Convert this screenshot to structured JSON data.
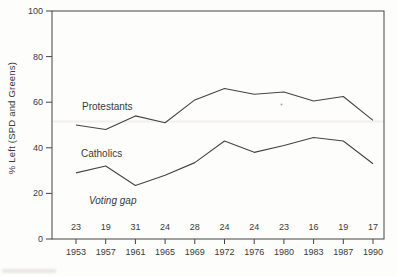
{
  "colors": {
    "background": "#fdfdfc",
    "frame": "#454545",
    "line": "#454545",
    "text": "#3a3a3a",
    "artifact": "#f1f0ec"
  },
  "chart_data": {
    "type": "line",
    "x": [
      "1953",
      "1957",
      "1961",
      "1965",
      "1969",
      "1972",
      "1976",
      "1980",
      "1983",
      "1987",
      "1990"
    ],
    "series": [
      {
        "name": "Protestants",
        "values": [
          50,
          48,
          54,
          51,
          61,
          66,
          63.5,
          64.5,
          60.5,
          62.5,
          52
        ]
      },
      {
        "name": "Catholics",
        "values": [
          29,
          32,
          23.5,
          28,
          33.5,
          43,
          38,
          41,
          44.5,
          43,
          33
        ]
      }
    ],
    "voting_gap": [
      23,
      19,
      31,
      24,
      28,
      24,
      24,
      23,
      16,
      19,
      17
    ],
    "ylabel": "% Left (SPD and Greens)",
    "xlabel": "",
    "ylim": [
      0,
      100
    ],
    "yticks": [
      0,
      20,
      40,
      60,
      80,
      100
    ],
    "grid": false,
    "legend": "inline",
    "annotations": {
      "gap_label": "Voting gap"
    }
  }
}
